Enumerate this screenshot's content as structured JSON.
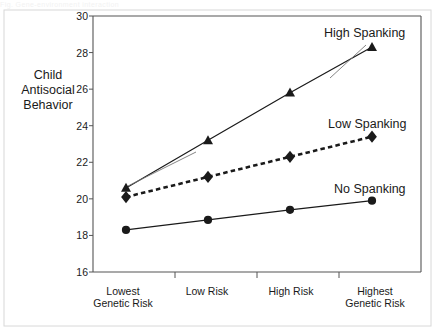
{
  "caption": {
    "text": "Fig.  Gene-environment interaction"
  },
  "chart_data": {
    "type": "line",
    "title": "",
    "xlabel": "",
    "ylabel": "Child Antisocial Behavior",
    "ylabel_lines": [
      "Child",
      "Antisocial",
      "Behavior"
    ],
    "categories": [
      "Lowest Genetic Risk",
      "Low Risk",
      "High Risk",
      "Highest Genetic Risk"
    ],
    "category_lines": [
      [
        "Lowest",
        "Genetic Risk"
      ],
      [
        "Low Risk",
        ""
      ],
      [
        "High Risk",
        ""
      ],
      [
        "Highest",
        "Genetic Risk"
      ]
    ],
    "ylim": [
      16,
      30
    ],
    "yticks": [
      16,
      18,
      20,
      22,
      24,
      26,
      28,
      30
    ],
    "grid": false,
    "legend_position": "inline-annotation",
    "series": [
      {
        "name": "High Spanking",
        "marker": "triangle",
        "line_style": "solid",
        "color": "#1a1a1a",
        "values": [
          20.6,
          23.2,
          25.8,
          28.3
        ]
      },
      {
        "name": "Low Spanking",
        "marker": "diamond",
        "line_style": "dashed",
        "color": "#1a1a1a",
        "values": [
          20.1,
          21.2,
          22.3,
          23.4
        ]
      },
      {
        "name": "No Spanking",
        "marker": "circle",
        "line_style": "solid",
        "color": "#1a1a1a",
        "values": [
          18.3,
          18.85,
          19.4,
          19.9
        ]
      }
    ]
  },
  "style": {
    "axis_color": "#555555",
    "ink": "#1a1a1a",
    "background": "#ffffff"
  }
}
